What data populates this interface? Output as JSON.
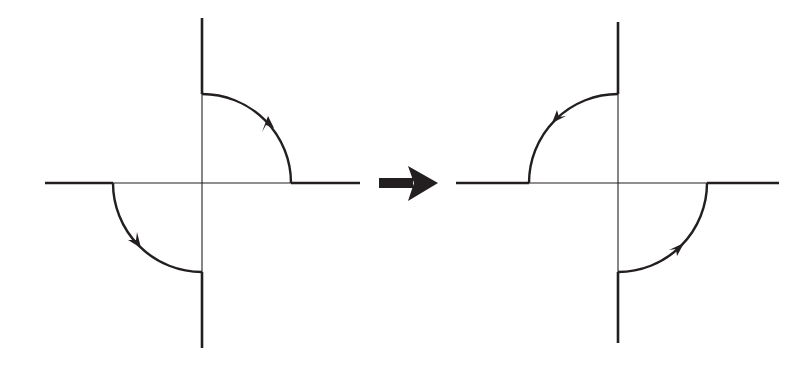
{
  "diagram": {
    "colors": {
      "stroke": "#231f20",
      "background": "#ffffff"
    },
    "left_figure": {
      "name": "before",
      "center": [
        202,
        183
      ],
      "radius": 89,
      "arcs": [
        {
          "quadrant": "upper-right",
          "from": "positive-x",
          "to": "positive-y",
          "direction": "counterclockwise"
        },
        {
          "quadrant": "lower-left",
          "from": "negative-x",
          "to": "negative-y",
          "direction": "counterclockwise"
        }
      ]
    },
    "transition_arrow": {
      "direction": "right",
      "icon": "right-arrow-icon"
    },
    "right_figure": {
      "name": "after",
      "center": [
        618,
        183
      ],
      "radius": 89,
      "arcs": [
        {
          "quadrant": "upper-left",
          "from": "positive-y",
          "to": "negative-x",
          "direction": "counterclockwise"
        },
        {
          "quadrant": "lower-right",
          "from": "negative-y",
          "to": "positive-x",
          "direction": "counterclockwise"
        }
      ]
    }
  }
}
